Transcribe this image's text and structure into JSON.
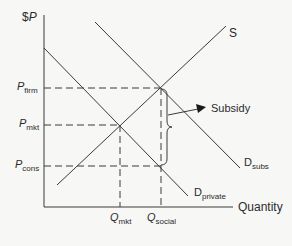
{
  "diagram": {
    "axes": {
      "y_label_prefix": "$",
      "y_label": "P",
      "x_label": "Quantity"
    },
    "curves": {
      "supply": {
        "label": "S"
      },
      "demand_subsidized": {
        "label_main": "D",
        "label_sub": "subs"
      },
      "demand_private": {
        "label_main": "D",
        "label_sub": "private"
      }
    },
    "price_levels": [
      {
        "main": "P",
        "sub": "firm"
      },
      {
        "main": "P",
        "sub": "mkt"
      },
      {
        "main": "P",
        "sub": "cons"
      }
    ],
    "quantity_levels": [
      {
        "main": "Q",
        "sub": "mkt"
      },
      {
        "main": "Q",
        "sub": "social"
      }
    ],
    "annotation": {
      "label": "Subsidy"
    },
    "colors": {
      "line": "#3a3a3a",
      "background": "#f7f7f6"
    }
  }
}
